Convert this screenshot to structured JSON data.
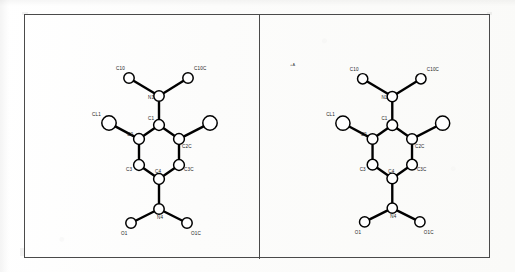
{
  "figure": {
    "border_color": "#4a4a4a",
    "background_color": "#fdfdfc",
    "bond_color": "#000000",
    "atom_fill_color": "#ffffff",
    "label_color": "#1a1a1a",
    "panel_count": 2
  },
  "chart_data": {
    "type": "diagram",
    "subtype": "ball-and-stick / ORTEP-style crystal structure",
    "panels": [
      {
        "name": "left-view",
        "labeled_atoms": [
          "C10",
          "C10C",
          "N1",
          "CL1",
          "C1",
          "C2",
          "C2C",
          "C3",
          "C3C",
          "C4",
          "O1",
          "N4",
          "O1C"
        ],
        "unlabeled_atoms": [
          "CL1C"
        ]
      },
      {
        "name": "right-view",
        "labeled_atoms": [
          "C10",
          "C10C",
          "N1",
          "CL1",
          "C1",
          "C2",
          "C2C",
          "C3",
          "C3C",
          "C4",
          "O1",
          "N4",
          "O1C"
        ],
        "unlabeled_atoms": [
          "CL1C"
        ],
        "corner_marker": "+A"
      }
    ],
    "atoms": [
      {
        "id": "C10",
        "label": "C10",
        "x": 104,
        "y": 63,
        "r": 5.2,
        "label_dx": -13,
        "label_dy": -8
      },
      {
        "id": "C10C",
        "label": "C10C",
        "x": 163,
        "y": 63,
        "r": 5.2,
        "label_dx": 6,
        "label_dy": -8
      },
      {
        "id": "N1",
        "label": "N1",
        "x": 134,
        "y": 81,
        "r": 5.2,
        "label_dx": -11,
        "label_dy": 3
      },
      {
        "id": "C1",
        "label": "C1",
        "x": 134,
        "y": 110,
        "r": 5.4,
        "label_dx": -11,
        "label_dy": -5
      },
      {
        "id": "CL1",
        "label": "CL1",
        "x": 84,
        "y": 108,
        "r": 7.2,
        "label_dx": -17,
        "label_dy": -7
      },
      {
        "id": "C2",
        "label": "C2",
        "x": 114,
        "y": 124,
        "r": 5.4,
        "label_dx": -12,
        "label_dy": -3
      },
      {
        "id": "C2C",
        "label": "C2C",
        "x": 154,
        "y": 124,
        "r": 5.4,
        "label_dx": 3,
        "label_dy": 9
      },
      {
        "id": "CL1C",
        "label": "",
        "x": 185,
        "y": 108,
        "r": 7.2,
        "label_dx": 0,
        "label_dy": 0
      },
      {
        "id": "C3",
        "label": "C3",
        "x": 114,
        "y": 150,
        "r": 5.4,
        "label_dx": -13,
        "label_dy": 6
      },
      {
        "id": "C3C",
        "label": "C3C",
        "x": 154,
        "y": 150,
        "r": 5.4,
        "label_dx": 5,
        "label_dy": 6
      },
      {
        "id": "C4",
        "label": "C4",
        "x": 134,
        "y": 164,
        "r": 5.4,
        "label_dx": -4,
        "label_dy": -6
      },
      {
        "id": "N4",
        "label": "N4",
        "x": 134,
        "y": 194,
        "r": 5.2,
        "label_dx": -2,
        "label_dy": 10
      },
      {
        "id": "O1",
        "label": "O1",
        "x": 106,
        "y": 208,
        "r": 5.2,
        "label_dx": -10,
        "label_dy": 12
      },
      {
        "id": "O1C",
        "label": "O1C",
        "x": 162,
        "y": 208,
        "r": 5.2,
        "label_dx": 4,
        "label_dy": 12
      }
    ],
    "bonds": [
      {
        "from": "C10",
        "to": "N1",
        "order": 1
      },
      {
        "from": "C10C",
        "to": "N1",
        "order": 1
      },
      {
        "from": "N1",
        "to": "C1",
        "order": 1
      },
      {
        "from": "C1",
        "to": "C2",
        "order": 1
      },
      {
        "from": "C1",
        "to": "C2C",
        "order": 1
      },
      {
        "from": "C2",
        "to": "CL1",
        "order": 1
      },
      {
        "from": "C2C",
        "to": "CL1C",
        "order": 1
      },
      {
        "from": "C2",
        "to": "C3",
        "order": 1
      },
      {
        "from": "C2C",
        "to": "C3C",
        "order": 1
      },
      {
        "from": "C3",
        "to": "C4",
        "order": 1
      },
      {
        "from": "C3C",
        "to": "C4",
        "order": 1
      },
      {
        "from": "C4",
        "to": "N4",
        "order": 1
      },
      {
        "from": "N4",
        "to": "O1",
        "order": 1
      },
      {
        "from": "N4",
        "to": "O1C",
        "order": 1
      }
    ]
  }
}
